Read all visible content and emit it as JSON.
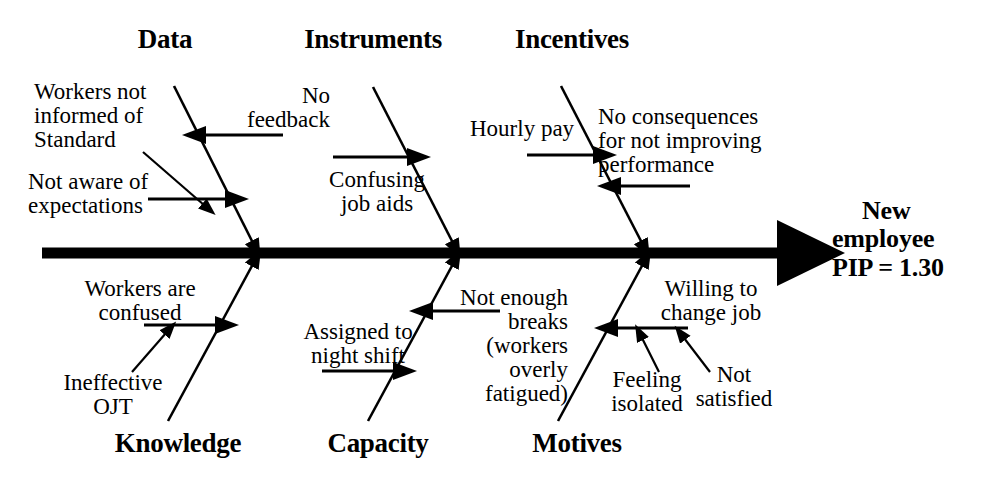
{
  "diagram": {
    "type": "fishbone-ishikawa",
    "effect": {
      "line1": "New",
      "line2": "employee",
      "line3": "PIP = 1.30"
    },
    "categories_top": [
      {
        "id": "data",
        "label": "Data"
      },
      {
        "id": "instruments",
        "label": "Instruments"
      },
      {
        "id": "incentives",
        "label": "Incentives"
      }
    ],
    "categories_bottom": [
      {
        "id": "knowledge",
        "label": "Knowledge"
      },
      {
        "id": "capacity",
        "label": "Capacity"
      },
      {
        "id": "motives",
        "label": "Motives"
      }
    ],
    "causes": {
      "data": [
        {
          "id": "workers-not-informed",
          "text": "Workers not\ninformed of\nStandard"
        },
        {
          "id": "not-aware-expectations",
          "text": "Not aware of\nexpectations"
        },
        {
          "id": "no-feedback",
          "text": "No\nfeedback"
        }
      ],
      "instruments": [
        {
          "id": "confusing-job-aids",
          "text": "Confusing\njob aids"
        }
      ],
      "incentives": [
        {
          "id": "hourly-pay",
          "text": "Hourly pay"
        },
        {
          "id": "no-consequences",
          "text": "No consequences\nfor not improving\nperformance"
        }
      ],
      "knowledge": [
        {
          "id": "workers-are-confused",
          "text": "Workers are\nconfused"
        },
        {
          "id": "ineffective-ojt",
          "text": "Ineffective\nOJT"
        }
      ],
      "capacity": [
        {
          "id": "assigned-night-shift",
          "text": "Assigned to\nnight shift"
        },
        {
          "id": "not-enough-breaks",
          "text": "Not enough\nbreaks\n(workers\noverly\nfatigued)"
        }
      ],
      "motives": [
        {
          "id": "willing-change-job",
          "text": "Willing to\nchange job"
        },
        {
          "id": "feeling-isolated",
          "text": "Feeling\nisolated"
        },
        {
          "id": "not-satisfied",
          "text": "Not\nsatisfied"
        }
      ]
    },
    "colors": {
      "stroke": "#000000",
      "background": "#ffffff"
    }
  }
}
